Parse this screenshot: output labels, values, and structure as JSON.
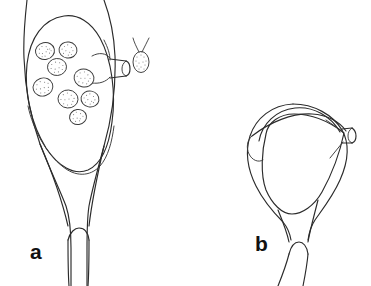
{
  "figure": {
    "kind": "scientific-line-drawing",
    "background_color": "#ffffff",
    "ink_color": "#2b2b2b",
    "stipple_color": "#7d7d7d",
    "width": 371,
    "height": 286,
    "panels": [
      {
        "id": "a",
        "label": "a",
        "label_x": 30,
        "label_y": 259,
        "description": "flask-shaped body with inner oval sac containing stippled eggs, lateral tubular spout, tapering stem with notched base",
        "egg_count": 8,
        "has_spout": true,
        "has_detached_egg": true
      },
      {
        "id": "b",
        "label": "b",
        "label_x": 255,
        "label_y": 251,
        "description": "flask-shaped body with overlapping dome outlines, lateral tubular spout, tapering stem with notched base",
        "egg_count": 0,
        "has_spout": true,
        "has_detached_egg": false
      }
    ],
    "detached_egg": {
      "name": "detached-egg-with-filaments",
      "center_x": 141,
      "center_y": 60,
      "rx": 8,
      "ry": 10.5,
      "filament_count": 2
    },
    "eggs_panel_a": [
      {
        "cx": 45,
        "cy": 51,
        "rx": 9.5,
        "ry": 8.5,
        "rot": -12
      },
      {
        "cx": 68,
        "cy": 50,
        "rx": 9.0,
        "ry": 8.0,
        "rot": 8
      },
      {
        "cx": 57,
        "cy": 67,
        "rx": 9.5,
        "ry": 8.5,
        "rot": -5
      },
      {
        "cx": 84,
        "cy": 78,
        "rx": 10.0,
        "ry": 9.0,
        "rot": 14
      },
      {
        "cx": 43,
        "cy": 87,
        "rx": 10.0,
        "ry": 9.0,
        "rot": -18
      },
      {
        "cx": 68,
        "cy": 99,
        "rx": 10.0,
        "ry": 9.0,
        "rot": 4
      },
      {
        "cx": 90,
        "cy": 99,
        "rx": 9.0,
        "ry": 8.0,
        "rot": 10
      },
      {
        "cx": 78,
        "cy": 117,
        "rx": 8.5,
        "ry": 7.5,
        "rot": -8
      }
    ]
  }
}
